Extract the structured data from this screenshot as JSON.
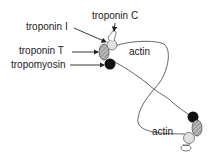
{
  "labels": {
    "troponin_c": "troponin C",
    "troponin_i": "troponin I",
    "troponin_t": "troponin T",
    "tropomyosin": "tropomyosin",
    "actin_top": "actin",
    "actin_bottom": "actin"
  },
  "colors": {
    "line": "#555555",
    "arrow": "#222222",
    "tropomyosin": "#111111",
    "troponin_t": "#999999",
    "troponin_i": "#dddddd",
    "troponin_c": "#ffffff"
  }
}
